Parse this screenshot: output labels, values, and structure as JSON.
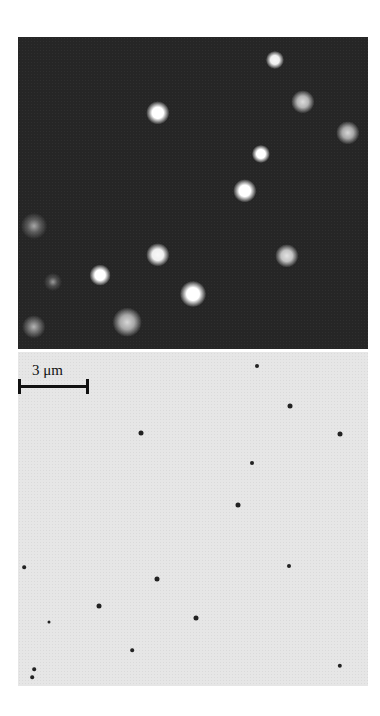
{
  "figure": {
    "top_panel": {
      "type": "fluorescence micrograph",
      "spots": [
        {
          "x": 275,
          "y": 60,
          "r": 7,
          "b": 0.95
        },
        {
          "x": 303,
          "y": 102,
          "r": 9,
          "b": 0.75
        },
        {
          "x": 158,
          "y": 113,
          "r": 9,
          "b": 1.0
        },
        {
          "x": 348,
          "y": 133,
          "r": 9,
          "b": 0.7
        },
        {
          "x": 261,
          "y": 154,
          "r": 7,
          "b": 1.0
        },
        {
          "x": 245,
          "y": 191,
          "r": 9,
          "b": 1.0
        },
        {
          "x": 34,
          "y": 226,
          "r": 10,
          "b": 0.35
        },
        {
          "x": 158,
          "y": 255,
          "r": 9,
          "b": 0.95
        },
        {
          "x": 287,
          "y": 256,
          "r": 9,
          "b": 0.8
        },
        {
          "x": 100,
          "y": 275,
          "r": 8,
          "b": 1.0
        },
        {
          "x": 53,
          "y": 282,
          "r": 7,
          "b": 0.25
        },
        {
          "x": 193,
          "y": 294,
          "r": 10,
          "b": 1.0
        },
        {
          "x": 127,
          "y": 322,
          "r": 11,
          "b": 0.7
        },
        {
          "x": 34,
          "y": 327,
          "r": 9,
          "b": 0.45
        }
      ]
    },
    "bottom_panel": {
      "type": "bright-field micrograph",
      "dots": [
        {
          "x": 290,
          "y": 406,
          "r": 2.5
        },
        {
          "x": 141,
          "y": 433,
          "r": 2.5
        },
        {
          "x": 340,
          "y": 434,
          "r": 2.5
        },
        {
          "x": 252,
          "y": 463,
          "r": 2
        },
        {
          "x": 238,
          "y": 505,
          "r": 2.5
        },
        {
          "x": 24,
          "y": 567,
          "r": 1.8
        },
        {
          "x": 289,
          "y": 566,
          "r": 2
        },
        {
          "x": 157,
          "y": 579,
          "r": 2.5
        },
        {
          "x": 99,
          "y": 606,
          "r": 2.5
        },
        {
          "x": 196,
          "y": 618,
          "r": 2.5
        },
        {
          "x": 49,
          "y": 622,
          "r": 1.5
        },
        {
          "x": 132,
          "y": 650,
          "r": 1.8
        },
        {
          "x": 340,
          "y": 666,
          "r": 2.2
        },
        {
          "x": 34,
          "y": 669,
          "r": 1.8
        },
        {
          "x": 32,
          "y": 677,
          "r": 1.8
        },
        {
          "x": 257,
          "y": 366,
          "r": 2
        }
      ]
    },
    "scale_bar": {
      "label": "3 μm"
    }
  }
}
